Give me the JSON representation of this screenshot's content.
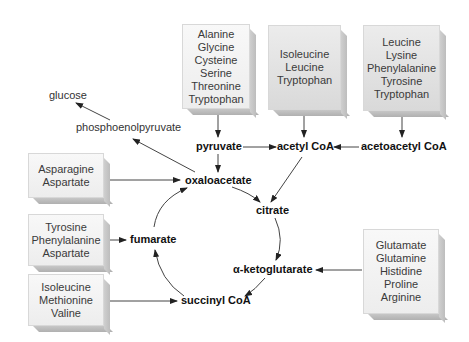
{
  "boxes": {
    "pyruvate_sources": [
      "Alanine",
      "Glycine",
      "Cysteine",
      "Serine",
      "Threonine",
      "Tryptophan"
    ],
    "acetyl_coa_sources": [
      "Isoleucine",
      "Leucine",
      "Tryptophan"
    ],
    "acetoacetyl_coa_sources": [
      "Leucine",
      "Lysine",
      "Phenylalanine",
      "Tyrosine",
      "Tryptophan"
    ],
    "oxaloacetate_sources": [
      "Asparagine",
      "Aspartate"
    ],
    "fumarate_sources": [
      "Tyrosine",
      "Phenylalanine",
      "Aspartate"
    ],
    "succinyl_coa_sources": [
      "Isoleucine",
      "Methionine",
      "Valine"
    ],
    "ketoglutarate_sources": [
      "Glutamate",
      "Glutamine",
      "Histidine",
      "Proline",
      "Arginine"
    ]
  },
  "metabolites": {
    "glucose": "glucose",
    "phosphoenolpyruvate": "phosphoenolpyruvate",
    "pyruvate": "pyruvate",
    "acetyl_coa": "acetyl CoA",
    "acetoacetyl_coa": "acetoacetyl CoA",
    "oxaloacetate": "oxaloacetate",
    "citrate": "citrate",
    "ketoglutarate": "α-ketoglutarate",
    "fumarate": "fumarate",
    "succinyl_coa": "succinyl CoA"
  }
}
